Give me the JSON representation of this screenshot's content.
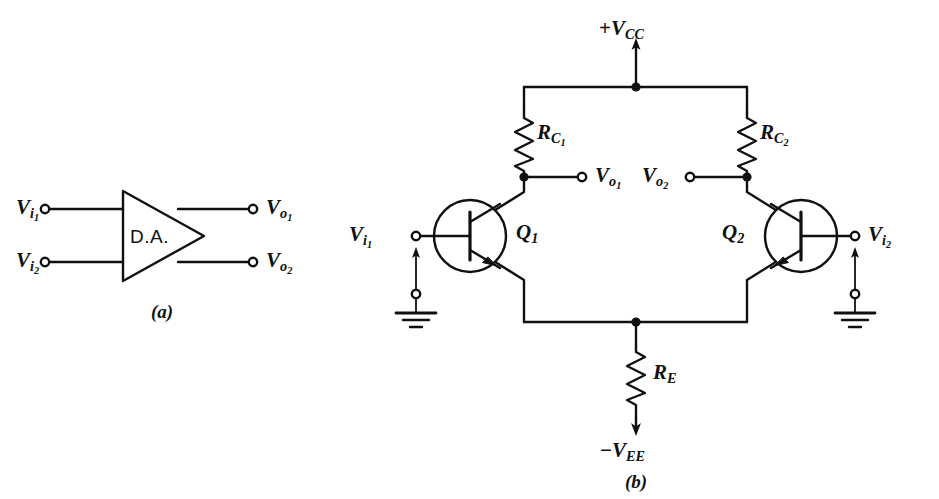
{
  "figure": {
    "ink_color": "#101010",
    "background": "#ffffff",
    "panels": [
      {
        "id": "a",
        "label": "(a)",
        "caption": "block symbol"
      },
      {
        "id": "b",
        "label": "(b)",
        "caption": "transistor schematic"
      }
    ]
  },
  "panel_a": {
    "label": "(a)",
    "block_name": "D.A.",
    "inputs": [
      {
        "name": "V",
        "sub": "i",
        "subsub": "1"
      },
      {
        "name": "V",
        "sub": "i",
        "subsub": "2"
      }
    ],
    "outputs": [
      {
        "name": "V",
        "sub": "o",
        "subsub": "1"
      },
      {
        "name": "V",
        "sub": "o",
        "subsub": "2"
      }
    ]
  },
  "panel_b": {
    "label": "(b)",
    "supply_positive": {
      "sign": "+",
      "name": "V",
      "sub": "CC"
    },
    "supply_negative": {
      "sign": "−",
      "name": "V",
      "sub": "EE"
    },
    "resistors": [
      {
        "name": "R",
        "sub": "C",
        "subsub": "1"
      },
      {
        "name": "R",
        "sub": "C",
        "subsub": "2"
      },
      {
        "name": "R",
        "sub": "E",
        "subsub": ""
      }
    ],
    "transistors": [
      {
        "name": "Q",
        "sub": "1",
        "type": "npn"
      },
      {
        "name": "Q",
        "sub": "2",
        "type": "npn"
      }
    ],
    "inputs": [
      {
        "name": "V",
        "sub": "i",
        "subsub": "1"
      },
      {
        "name": "V",
        "sub": "i",
        "subsub": "2"
      }
    ],
    "outputs": [
      {
        "name": "V",
        "sub": "o",
        "subsub": "1"
      },
      {
        "name": "V",
        "sub": "o",
        "subsub": "2"
      }
    ],
    "grounds": [
      {
        "side": "left"
      },
      {
        "side": "right"
      }
    ]
  }
}
